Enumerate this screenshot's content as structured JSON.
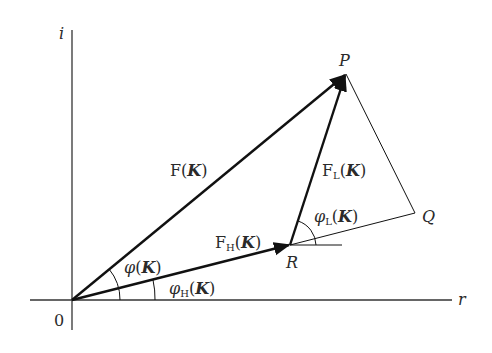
{
  "diagram": {
    "colors": {
      "line": "#111111",
      "text": "#2a2a2a",
      "axis": "#333333"
    },
    "axes": {
      "horizontal_label": "r",
      "vertical_label": "i",
      "origin_label": "0"
    },
    "points": {
      "P": "P",
      "Q": "Q",
      "R": "R"
    },
    "vectors": {
      "F": {
        "main": "F",
        "sub": "",
        "arg": "K"
      },
      "FH": {
        "main": "F",
        "sub": "H",
        "arg": "K"
      },
      "FL": {
        "main": "F",
        "sub": "L",
        "arg": "K"
      }
    },
    "angles": {
      "phi": {
        "main": "φ",
        "sub": "",
        "arg": "K"
      },
      "phiH": {
        "main": "φ",
        "sub": "H",
        "arg": "K"
      },
      "phiL": {
        "main": "φ",
        "sub": "L",
        "arg": "K"
      }
    },
    "paren_open": "(",
    "paren_close": ")"
  }
}
